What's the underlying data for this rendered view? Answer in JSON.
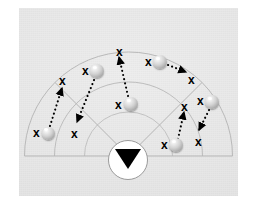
{
  "figure": {
    "domain_kind": "diagram",
    "title": "",
    "panel": {
      "background_color": "#e6e6e6",
      "border_color": "#ffffff"
    }
  },
  "sector": {
    "center": {
      "x": 128.5,
      "y": 156
    },
    "baseline_y": 156,
    "arcs": [
      {
        "name": "outer-arc",
        "radius": 104,
        "stroke": "#b9b9b9",
        "width": 1.0
      },
      {
        "name": "middle-arc",
        "radius": 74,
        "stroke": "#bdbdbd",
        "width": 1.0
      },
      {
        "name": "inner-arc",
        "radius": 44,
        "stroke": "#c2c2c2",
        "width": 1.0
      }
    ],
    "radial_lines": [
      {
        "name": "radial-left",
        "angle_deg": 135
      },
      {
        "name": "radial-right",
        "angle_deg": 45
      }
    ],
    "baseline": {
      "name": "sector-baseline",
      "stroke": "#b5b5b5",
      "width": 1.0
    }
  },
  "observer": {
    "label": "observer",
    "icon": "triangle-down-icon",
    "circle": {
      "cx": 128,
      "cy": 160,
      "r": 20,
      "fill": "#ffffff",
      "stroke": "#9a9a9a"
    },
    "triangle": {
      "fill": "#000000",
      "width": 26,
      "height": 20
    }
  },
  "targets": [
    {
      "id": "t1",
      "name": "target-ball-1",
      "x": 48,
      "y": 133,
      "d": 13
    },
    {
      "id": "t2",
      "name": "target-ball-2",
      "x": 97,
      "y": 71,
      "d": 14
    },
    {
      "id": "t3",
      "name": "target-ball-3",
      "x": 131,
      "y": 104,
      "d": 14
    },
    {
      "id": "t4",
      "name": "target-ball-4",
      "x": 160,
      "y": 62,
      "d": 14
    },
    {
      "id": "t5",
      "name": "target-ball-5",
      "x": 212,
      "y": 102,
      "d": 14
    },
    {
      "id": "t6",
      "name": "target-ball-6",
      "x": 176,
      "y": 145,
      "d": 14
    },
    {
      "id": "t7",
      "name": "target-ball-7",
      "x": 212,
      "y": 102,
      "d": 0
    }
  ],
  "marks": [
    {
      "id": "x1",
      "label": "x",
      "x": 33,
      "y": 127
    },
    {
      "id": "x2",
      "label": "x",
      "x": 59,
      "y": 75
    },
    {
      "id": "x3",
      "label": "x",
      "x": 71,
      "y": 128
    },
    {
      "id": "x4",
      "label": "x",
      "x": 82,
      "y": 65
    },
    {
      "id": "x5",
      "label": "x",
      "x": 116,
      "y": 46
    },
    {
      "id": "x6",
      "label": "x",
      "x": 115,
      "y": 99
    },
    {
      "id": "x7",
      "label": "x",
      "x": 145,
      "y": 56
    },
    {
      "id": "x8",
      "label": "x",
      "x": 188,
      "y": 74
    },
    {
      "id": "x9",
      "label": "x",
      "x": 181,
      "y": 101
    },
    {
      "id": "x10",
      "label": "x",
      "x": 197,
      "y": 95
    },
    {
      "id": "x11",
      "label": "x",
      "x": 161,
      "y": 139
    },
    {
      "id": "x12",
      "label": "x",
      "x": 195,
      "y": 136
    }
  ],
  "arrows": [
    {
      "id": "a1",
      "name": "motion-arrow-1",
      "from": "target-ball-1",
      "to": "x2",
      "x1": 50,
      "y1": 126,
      "x2": 62,
      "y2": 88,
      "style": "dotted",
      "head": "solid-triangle"
    },
    {
      "id": "a2",
      "name": "motion-arrow-2",
      "from": "target-ball-2",
      "to": "x3",
      "x1": 94,
      "y1": 80,
      "x2": 77,
      "y2": 122,
      "style": "dotted",
      "head": "solid-triangle"
    },
    {
      "id": "a3",
      "name": "motion-arrow-3",
      "from": "target-ball-3",
      "to": "x5",
      "x1": 128,
      "y1": 96,
      "x2": 119,
      "y2": 57,
      "style": "dotted",
      "head": "solid-triangle"
    },
    {
      "id": "a4",
      "name": "motion-arrow-4",
      "from": "target-ball-4",
      "to": "x8",
      "x1": 168,
      "y1": 65,
      "x2": 186,
      "y2": 72,
      "style": "dotted",
      "head": "solid-triangle"
    },
    {
      "id": "a5",
      "name": "motion-arrow-5",
      "from": "target-ball-5",
      "to": "x12",
      "x1": 209,
      "y1": 110,
      "x2": 199,
      "y2": 130,
      "style": "dotted",
      "head": "solid-triangle"
    },
    {
      "id": "a6",
      "name": "motion-arrow-6",
      "from": "target-ball-6",
      "to": "x9",
      "x1": 178,
      "y1": 139,
      "x2": 184,
      "y2": 112,
      "style": "dotted",
      "head": "solid-triangle"
    }
  ],
  "style": {
    "mark_color": "#000000",
    "arrow_color": "#000000",
    "ball_fill": "#cfcfcf",
    "arc_color": "#b9b9b9"
  }
}
